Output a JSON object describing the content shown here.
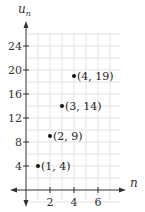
{
  "chart_data": {
    "type": "scatter",
    "title": "",
    "xlabel": "n",
    "ylabel": "u_n",
    "ylabel_main": "u",
    "ylabel_sub": "n",
    "xlim": [
      -1,
      7.5
    ],
    "ylim": [
      -3,
      26
    ],
    "grid": true,
    "x_ticks": [
      2,
      4,
      6
    ],
    "y_ticks": [
      4,
      8,
      12,
      16,
      20,
      24
    ],
    "points": [
      {
        "x": 1,
        "y": 4,
        "label": "(1, 4)"
      },
      {
        "x": 2,
        "y": 9,
        "label": "(2, 9)"
      },
      {
        "x": 3,
        "y": 14,
        "label": "(3, 14)"
      },
      {
        "x": 4,
        "y": 19,
        "label": "(4, 19)"
      }
    ],
    "colors": {
      "grid": "#e3e3e3",
      "axis": "#333333",
      "point": "#111111"
    }
  }
}
